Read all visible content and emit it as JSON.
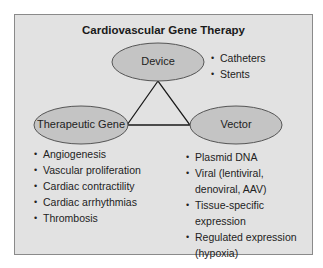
{
  "title": "Cardiovascular Gene Therapy",
  "nodes": {
    "device": {
      "label": "Device",
      "items": [
        "Catheters",
        "Stents"
      ]
    },
    "therapeutic_gene": {
      "label": "Therapeutic Gene",
      "items": [
        "Angiogenesis",
        "Vascular proliferation",
        "Cardiac contractility",
        "Cardiac arrhythmias",
        "Thrombosis"
      ]
    },
    "vector": {
      "label": "Vector",
      "items": [
        "Plasmid DNA",
        "Viral (lentiviral, denoviral, AAV)",
        "Tissue-specific expression",
        "Regulated expression (hypoxia)"
      ]
    }
  },
  "colors": {
    "frame_bg": "#e2e2e2",
    "ellipse_fill": "#c4c4c4",
    "line": "#1a1a1a"
  }
}
